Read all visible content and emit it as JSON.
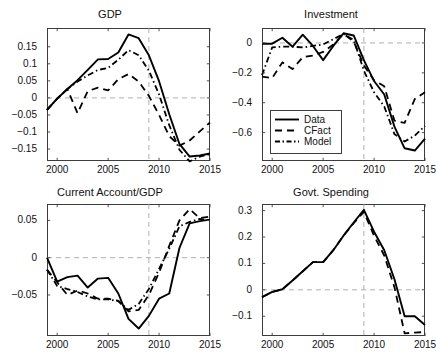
{
  "figure": {
    "width": 435,
    "height": 364,
    "background": "#ffffff",
    "line_color": "#000000",
    "axis_color": "#3d3d3d",
    "guide_color": "#9a9a9a"
  },
  "legend": {
    "position": "inside-bottom-left-of-investment-panel",
    "entries": [
      {
        "label": "Data",
        "style": "solid",
        "dash": "none"
      },
      {
        "label": "CFact",
        "style": "dashed",
        "dash": "7,5"
      },
      {
        "label": "Model",
        "style": "dash-dot",
        "dash": "6,3,1.5,3"
      }
    ]
  },
  "chart_data": [
    {
      "type": "line",
      "title": "GDP",
      "xlabel": "",
      "ylabel": "",
      "xlim": [
        1999,
        2015
      ],
      "ylim": [
        -0.185,
        0.205
      ],
      "xticks": [
        2000,
        2005,
        2010,
        2015
      ],
      "yticks": [
        0.15,
        0.1,
        0.05,
        0,
        -0.05,
        -0.1,
        -0.15
      ],
      "ytick_labels": [
        "0.15",
        "0.1",
        "0.05",
        "0",
        "−0.05",
        "−0.1",
        "−0.15"
      ],
      "xtick_labels": [
        "2000",
        "2005",
        "2010",
        "2015"
      ],
      "grid": false,
      "guides": {
        "hline": 0,
        "vline": 2009
      },
      "x": [
        1999,
        2000,
        2001,
        2002,
        2003,
        2004,
        2005,
        2006,
        2007,
        2008,
        2009,
        2010,
        2011,
        2012,
        2013,
        2014,
        2015
      ],
      "series": [
        {
          "name": "Data",
          "values": [
            -0.035,
            -0.002,
            0.026,
            0.052,
            0.082,
            0.113,
            0.114,
            0.133,
            0.186,
            0.175,
            0.125,
            0.049,
            -0.048,
            -0.135,
            -0.172,
            -0.169,
            -0.163
          ]
        },
        {
          "name": "CFact",
          "values": [
            -0.035,
            -0.002,
            0.026,
            -0.045,
            0.02,
            0.03,
            0.022,
            0.055,
            0.07,
            0.048,
            0.006,
            -0.05,
            -0.112,
            -0.14,
            -0.125,
            -0.098,
            -0.072
          ]
        },
        {
          "name": "Model",
          "values": [
            -0.035,
            -0.002,
            0.026,
            0.048,
            0.066,
            0.082,
            0.088,
            0.112,
            0.14,
            0.125,
            0.08,
            0.01,
            -0.08,
            -0.152,
            -0.186,
            -0.172,
            -0.165
          ]
        }
      ]
    },
    {
      "type": "line",
      "title": "Investment",
      "xlabel": "",
      "ylabel": "",
      "xlim": [
        1999,
        2015
      ],
      "ylim": [
        -0.79,
        0.1
      ],
      "xticks": [
        2000,
        2005,
        2010,
        2015
      ],
      "yticks": [
        0,
        -0.2,
        -0.4,
        -0.6
      ],
      "ytick_labels": [
        "0",
        "−0.2",
        "−0.4",
        "−0.6"
      ],
      "xtick_labels": [
        "2000",
        "2005",
        "2010",
        "2015"
      ],
      "grid": false,
      "guides": {
        "hline": 0,
        "vline": 2009
      },
      "x": [
        1999,
        2000,
        2001,
        2002,
        2003,
        2004,
        2005,
        2006,
        2007,
        2008,
        2009,
        2010,
        2011,
        2012,
        2013,
        2014,
        2015
      ],
      "series": [
        {
          "name": "Data",
          "values": [
            -0.005,
            -0.005,
            0.035,
            -0.025,
            0.055,
            -0.02,
            -0.115,
            -0.02,
            0.065,
            0.05,
            -0.115,
            -0.255,
            -0.345,
            -0.56,
            -0.705,
            -0.72,
            -0.64
          ]
        },
        {
          "name": "CFact",
          "values": [
            -0.225,
            -0.235,
            -0.13,
            -0.175,
            -0.095,
            -0.085,
            -0.06,
            -0.01,
            0.06,
            0.01,
            -0.15,
            -0.25,
            -0.29,
            -0.52,
            -0.535,
            -0.375,
            -0.33
          ]
        },
        {
          "name": "Model",
          "values": [
            -0.215,
            -0.03,
            -0.025,
            -0.025,
            -0.03,
            -0.02,
            -0.01,
            0.025,
            0.06,
            0.02,
            -0.185,
            -0.33,
            -0.425,
            -0.61,
            -0.66,
            -0.62,
            -0.555
          ]
        }
      ]
    },
    {
      "type": "line",
      "title": "Current Account/GDP",
      "xlabel": "",
      "ylabel": "",
      "xlim": [
        1999,
        2015
      ],
      "ylim": [
        -0.105,
        0.072
      ],
      "xticks": [
        2000,
        2005,
        2010,
        2015
      ],
      "yticks": [
        0.05,
        0,
        -0.05
      ],
      "ytick_labels": [
        "0.05",
        "0",
        "−0.05"
      ],
      "xtick_labels": [
        "2000",
        "2005",
        "2010",
        "2015"
      ],
      "grid": false,
      "guides": {
        "hline": 0,
        "vline": 2009
      },
      "x": [
        1999,
        2000,
        2001,
        2002,
        2003,
        2004,
        2005,
        2006,
        2007,
        2008,
        2009,
        2010,
        2011,
        2012,
        2013,
        2014,
        2015
      ],
      "series": [
        {
          "name": "Data",
          "values": [
            0.0,
            -0.032,
            -0.026,
            -0.024,
            -0.04,
            -0.028,
            -0.027,
            -0.048,
            -0.082,
            -0.095,
            -0.078,
            -0.055,
            -0.048,
            0.013,
            0.046,
            0.049,
            0.051
          ]
        },
        {
          "name": "CFact",
          "values": [
            -0.016,
            -0.033,
            -0.05,
            -0.044,
            -0.048,
            -0.055,
            -0.055,
            -0.058,
            -0.072,
            -0.07,
            -0.05,
            -0.02,
            0.016,
            0.05,
            0.065,
            0.053,
            0.055
          ]
        },
        {
          "name": "Model",
          "values": [
            -0.016,
            -0.038,
            -0.042,
            -0.046,
            -0.052,
            -0.056,
            -0.056,
            -0.058,
            -0.07,
            -0.062,
            -0.042,
            -0.015,
            0.012,
            0.042,
            0.048,
            0.052,
            0.05
          ]
        }
      ]
    },
    {
      "type": "line",
      "title": "Govt. Spending",
      "xlabel": "",
      "ylabel": "",
      "xlim": [
        1999,
        2015
      ],
      "ylim": [
        -0.175,
        0.325
      ],
      "xticks": [
        2000,
        2005,
        2010,
        2015
      ],
      "yticks": [
        0.3,
        0.2,
        0.1,
        0,
        -0.1
      ],
      "ytick_labels": [
        "0.3",
        "0.2",
        "0.1",
        "0",
        "−0.1"
      ],
      "xtick_labels": [
        "2000",
        "2005",
        "2010",
        "2015"
      ],
      "grid": false,
      "guides": {
        "hline": 0,
        "vline": 2009
      },
      "x": [
        1999,
        2000,
        2001,
        2002,
        2003,
        2004,
        2005,
        2006,
        2007,
        2008,
        2009,
        2010,
        2011,
        2012,
        2013,
        2014,
        2015
      ],
      "series": [
        {
          "name": "Data",
          "values": [
            -0.028,
            -0.008,
            0.002,
            0.035,
            0.07,
            0.105,
            0.105,
            0.15,
            0.205,
            0.255,
            0.303,
            0.22,
            0.15,
            0.04,
            -0.1,
            -0.1,
            -0.133
          ]
        },
        {
          "name": "CFact",
          "values": [
            -0.028,
            -0.008,
            0.002,
            0.035,
            0.07,
            0.105,
            0.105,
            0.15,
            0.205,
            0.252,
            0.295,
            0.205,
            0.13,
            0.01,
            -0.165,
            -0.162,
            -0.16
          ]
        }
      ]
    }
  ]
}
